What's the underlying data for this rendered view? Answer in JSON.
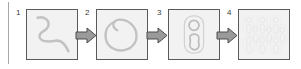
{
  "figure": {
    "type": "process-flow-diagram",
    "orientation": "horizontal",
    "background_color": "#ffffff",
    "panel_fill": "#f2f2f2",
    "panel_border_color": "#5a5a5a",
    "stroke_color": "#bdbdbd",
    "arrow_fill": "#9a9a9a",
    "arrow_border": "#4d4d4d",
    "label_color": "#3d3d3d",
    "rule_color": "#a8a8a8"
  },
  "steps": [
    {
      "number": "1",
      "icon": "open-squiggle-curve-icon",
      "description": "open meandering curve"
    },
    {
      "number": "2",
      "icon": "closed-loop-icon",
      "description": "closed loop with inward hook"
    },
    {
      "number": "3",
      "icon": "rounded-capsule-with-circle-and-blob-icon",
      "description": "rounded outline containing circle and elongated blob"
    },
    {
      "number": "4",
      "icon": "tiled-array-pattern-icon",
      "description": "repeating tiled array of the motif"
    }
  ],
  "arrows": [
    {
      "name": "arrow-1-to-2",
      "direction": "right"
    },
    {
      "name": "arrow-2-to-3",
      "direction": "right"
    },
    {
      "name": "arrow-3-to-4",
      "direction": "right"
    }
  ]
}
